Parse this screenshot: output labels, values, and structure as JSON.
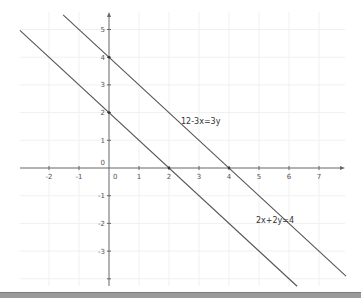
{
  "chart_data": {
    "type": "line",
    "title": "",
    "xlabel": "",
    "ylabel": "",
    "xlim": [
      -2.97,
      7.8
    ],
    "ylim": [
      -4.2,
      5.5
    ],
    "grid": true,
    "x_ticks": [
      -2,
      -1,
      0,
      1,
      2,
      3,
      4,
      5,
      6,
      7
    ],
    "x_tick_labels": [
      "-2",
      "-1",
      "0",
      "1",
      "2",
      "3",
      "4",
      "5",
      "6",
      "7"
    ],
    "y_ticks": [
      5,
      4,
      3,
      2,
      1,
      0,
      -1,
      -2,
      -3,
      -4
    ],
    "y_tick_labels": [
      "5",
      "4",
      "3",
      "2",
      "1",
      "0",
      "-1",
      "-2",
      "-3",
      ""
    ],
    "series": [
      {
        "name": "2x+2y=4",
        "equation": "y = 2 - x",
        "x": [
          -2.97,
          6.27
        ],
        "y": [
          4.97,
          -4.27
        ],
        "label": "2x+2y=4",
        "label_at": [
          4.9,
          -2.0
        ]
      },
      {
        "name": "12-3x=3y",
        "equation": "y = 4 - x",
        "x": [
          -1.53,
          7.9
        ],
        "y": [
          5.53,
          -3.9
        ],
        "label": "12-3x=3y",
        "label_at": [
          2.4,
          1.6
        ]
      }
    ],
    "intercepts": [
      {
        "x": 0,
        "y": 2
      },
      {
        "x": 2,
        "y": 0
      },
      {
        "x": 0,
        "y": 4
      },
      {
        "x": 4,
        "y": 0
      }
    ],
    "colors": {
      "line": "#555555",
      "axis": "#666666",
      "grid": "#f0f0f0"
    }
  }
}
